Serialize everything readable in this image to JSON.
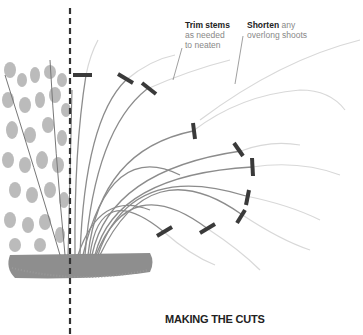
{
  "annotations": {
    "trim": {
      "bold": "Trim stems",
      "rest_line1": "as needed",
      "rest_line2": "to neaten"
    },
    "shorten": {
      "bold": "Shorten",
      "rest_line1": " any",
      "rest_line2": "overlong shoots"
    }
  },
  "caption": "MAKING THE CUTS",
  "colors": {
    "cut_mark": "#3a3a3a",
    "stem": "#8a8a8a",
    "faded_stem": "#d4d4d4",
    "leaf": "#a8a8a8",
    "soil": "#6e6e6e",
    "divider": "#333333"
  },
  "icons": {
    "cut_marks": 10,
    "divider": "dashed-vertical-line"
  }
}
